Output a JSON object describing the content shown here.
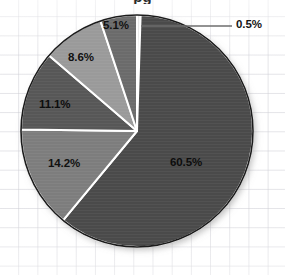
{
  "chart_data": {
    "type": "pie",
    "title": "",
    "title_cropped_fragment": "pg",
    "xlabel": "",
    "ylabel": "",
    "grid": true,
    "legend": "none",
    "labels_format": "percent",
    "categories": [
      "0.5%",
      "60.5%",
      "14.2%",
      "11.1%",
      "8.6%",
      "5.1%"
    ],
    "values": [
      0.5,
      60.5,
      14.2,
      11.1,
      8.6,
      5.1
    ],
    "start_angle_deg": 0,
    "direction": "clockwise",
    "slices": [
      {
        "label": "0.5%",
        "value": 0.5,
        "color": "#e9e9e9",
        "label_placement": "outside-leader"
      },
      {
        "label": "60.5%",
        "value": 60.5,
        "color": "#4a4a4a",
        "label_placement": "inside"
      },
      {
        "label": "14.2%",
        "value": 14.2,
        "color": "#7d7d7d",
        "label_placement": "inside"
      },
      {
        "label": "11.1%",
        "value": 11.1,
        "color": "#575757",
        "label_placement": "inside"
      },
      {
        "label": "8.6%",
        "value": 8.6,
        "color": "#9a9a9a",
        "label_placement": "inside"
      },
      {
        "label": "5.1%",
        "value": 5.1,
        "color": "#6b6b6b",
        "label_placement": "inside"
      }
    ],
    "colors": {
      "background": "#ffffff",
      "grid_line": "#cdcdd4",
      "slice_outline": "#ffffff",
      "pie_border": "#1c1c1c",
      "label_text": "#141414",
      "leader_line": "#6e6e6e"
    }
  },
  "geometry": {
    "center_x": 137,
    "center_y": 131,
    "radius": 116
  },
  "leader": {
    "label": "0.5%",
    "x1": 141,
    "y1": 26,
    "x2": 232,
    "y2": 26
  }
}
